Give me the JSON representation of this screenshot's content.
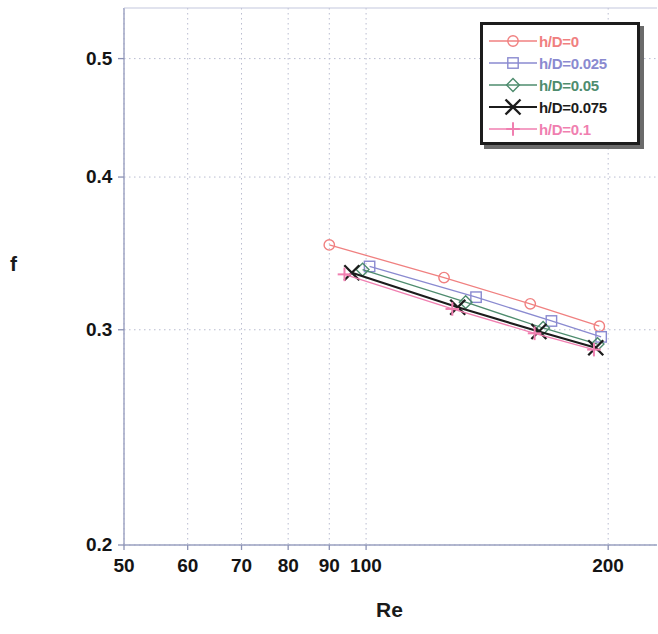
{
  "chart_data": {
    "type": "line",
    "title": "",
    "xlabel": "Re",
    "ylabel": "f",
    "xscale": "log",
    "yscale": "log",
    "xlim": [
      50,
      230
    ],
    "ylim": [
      0.2,
      0.55
    ],
    "xticks": [
      50,
      60,
      70,
      80,
      90,
      100,
      200
    ],
    "xticklabels": [
      "50",
      "60",
      "70",
      "80",
      "90",
      "100",
      "200"
    ],
    "yticks": [
      0.2,
      0.3,
      0.4,
      0.5
    ],
    "yticklabels": [
      "0.2",
      "0.3",
      "0.4",
      "0.5"
    ],
    "grid": true,
    "legend_position": "top-right",
    "series": [
      {
        "name": "h/D=0",
        "color": "#f08080",
        "marker": "circle",
        "x": [
          90,
          125,
          160,
          195
        ],
        "y": [
          0.352,
          0.331,
          0.315,
          0.302
        ]
      },
      {
        "name": "h/D=0.025",
        "color": "#8a8ad0",
        "marker": "square",
        "x": [
          101,
          137,
          170,
          196
        ],
        "y": [
          0.338,
          0.319,
          0.305,
          0.296
        ]
      },
      {
        "name": "h/D=0.05",
        "color": "#4e8c6e",
        "marker": "diamond",
        "x": [
          99,
          133,
          166,
          194
        ],
        "y": [
          0.336,
          0.316,
          0.301,
          0.292
        ]
      },
      {
        "name": "h/D=0.075",
        "color": "#1c1c1c",
        "marker": "x",
        "x": [
          96,
          130,
          164,
          193
        ],
        "y": [
          0.334,
          0.313,
          0.299,
          0.29
        ]
      },
      {
        "name": "h/D=0.1",
        "color": "#f07fb0",
        "marker": "plus",
        "x": [
          94,
          128,
          162,
          192
        ],
        "y": [
          0.333,
          0.312,
          0.298,
          0.289
        ]
      }
    ]
  },
  "legend": {
    "entries": [
      {
        "label": "h/D=0"
      },
      {
        "label": "h/D=0.025"
      },
      {
        "label": "h/D=0.05"
      },
      {
        "label": "h/D=0.075"
      },
      {
        "label": "h/D=0.1"
      }
    ]
  },
  "axes": {
    "x_title": "Re",
    "y_title": "f"
  }
}
